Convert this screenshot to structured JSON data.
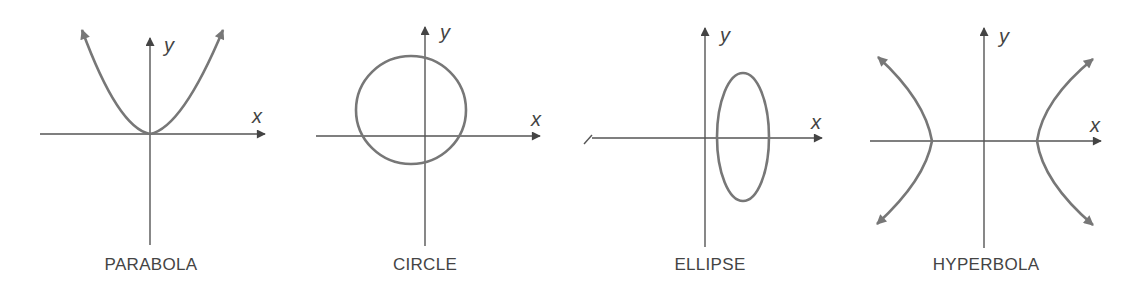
{
  "figures": [
    {
      "id": "parabola",
      "caption": "PARABOLA",
      "x_label": "x",
      "y_label": "y"
    },
    {
      "id": "circle",
      "caption": "CIRCLE",
      "x_label": "x",
      "y_label": "y"
    },
    {
      "id": "ellipse",
      "caption": "ELLIPSE",
      "x_label": "x",
      "y_label": "y"
    },
    {
      "id": "hyperbola",
      "caption": "HYPERBOLA",
      "x_label": "x",
      "y_label": "y"
    }
  ],
  "colors": {
    "axis": "#555555",
    "curve": "#777777",
    "text": "#444444",
    "background": "#ffffff"
  }
}
